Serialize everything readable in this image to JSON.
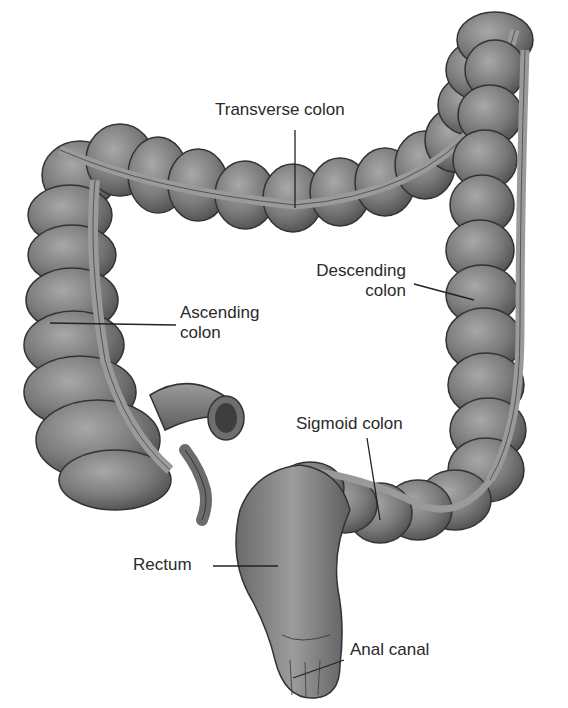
{
  "diagram": {
    "labels": {
      "transverse": "Transverse colon",
      "descending_line1": "Descending",
      "descending_line2": "colon",
      "ascending_line1": "Ascending",
      "ascending_line2": "colon",
      "sigmoid": "Sigmoid colon",
      "rectum": "Rectum",
      "anal_canal": "Anal canal"
    },
    "colors": {
      "tissue_dark": "#5a5a5a",
      "tissue_mid": "#7c7c7c",
      "tissue_light": "#a4a4a4",
      "taenia": "#9a9a9a",
      "outline": "#333333",
      "leader_line": "#222222",
      "text": "#2a2a2a",
      "background": "#ffffff"
    }
  }
}
